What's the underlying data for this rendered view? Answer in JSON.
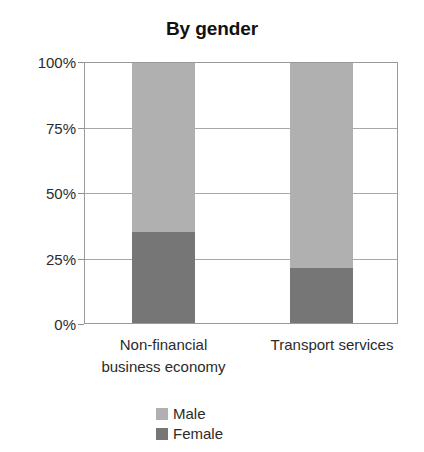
{
  "chart_data": {
    "type": "bar",
    "subtype": "stacked-percentage-column",
    "title": "By gender",
    "xlabel": "",
    "ylabel": "",
    "categories": [
      "Non-financial business economy",
      "Transport services"
    ],
    "category_lines": [
      [
        "Non-financial",
        "business economy"
      ],
      [
        "Transport services"
      ]
    ],
    "series": [
      {
        "name": "Male",
        "values": [
          65,
          79
        ],
        "color": "#b0b0b0"
      },
      {
        "name": "Female",
        "values": [
          35,
          21
        ],
        "color": "#767676"
      }
    ],
    "stack_order_bottom_to_top": [
      "Female",
      "Male"
    ],
    "ylim": [
      0,
      100
    ],
    "yticks": [
      0,
      25,
      50,
      75,
      100
    ],
    "ytick_labels": [
      "0%",
      "25%",
      "50%",
      "75%",
      "100%"
    ],
    "grid": true,
    "grid_axis": "y",
    "legend_position": "bottom",
    "legend_entries": [
      "Male",
      "Female"
    ],
    "units": "percent"
  },
  "axis": {
    "y_ticks": [
      {
        "label": "100%",
        "value": 100
      },
      {
        "label": "75%",
        "value": 75
      },
      {
        "label": "50%",
        "value": 50
      },
      {
        "label": "25%",
        "value": 25
      },
      {
        "label": "0%",
        "value": 0
      }
    ]
  },
  "legend": {
    "items": [
      {
        "label": "Male",
        "swatch": "legend-swatch-male-icon"
      },
      {
        "label": "Female",
        "swatch": "legend-swatch-female-icon"
      }
    ]
  },
  "colors": {
    "male": "#b0b0b0",
    "female": "#767676",
    "gridline": "#a8a8a8",
    "axis": "#9a9a9a",
    "text": "#2b2b2b",
    "title": "#111111",
    "background": "#ffffff"
  }
}
